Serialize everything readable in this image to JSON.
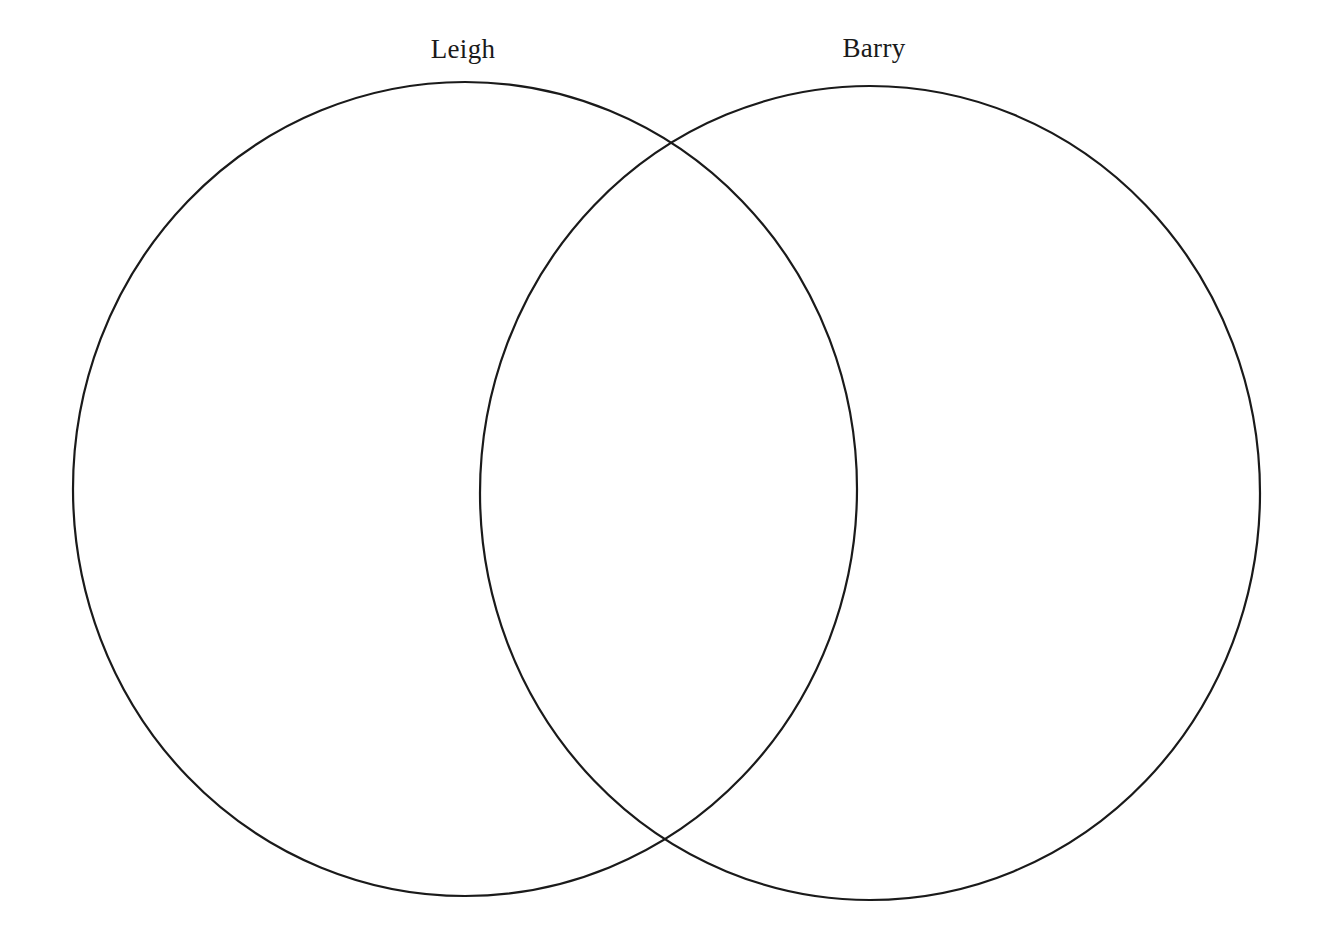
{
  "diagram": {
    "type": "venn",
    "stroke_color": "#1a1a1a",
    "background": "#ffffff",
    "sets": [
      {
        "label": "Leigh",
        "label_pos": {
          "x": 463,
          "y": 34
        },
        "ellipse": {
          "cx": 465,
          "cy": 489,
          "rx": 392,
          "ry": 407
        }
      },
      {
        "label": "Barry",
        "label_pos": {
          "x": 874,
          "y": 33
        },
        "ellipse": {
          "cx": 870,
          "cy": 493,
          "rx": 390,
          "ry": 407
        }
      }
    ],
    "regions": {
      "leigh_only": [],
      "both": [],
      "barry_only": []
    }
  }
}
